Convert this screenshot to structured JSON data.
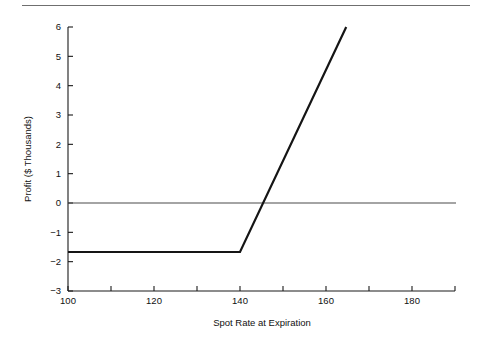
{
  "figure": {
    "top_rule_color": "#6f6f6f",
    "background": "#ffffff",
    "line_color": "#151515",
    "axis_color": "#1a1a1a",
    "zero_line_color": "#4a4a4a"
  },
  "chart_data": {
    "type": "line",
    "title": "",
    "xlabel": "Spot Rate at Expiration",
    "ylabel": "Profit ($ Thousands)",
    "xlim": [
      100,
      190
    ],
    "ylim": [
      -3,
      6
    ],
    "grid": false,
    "legend": "none",
    "x_ticks": [
      100,
      110,
      120,
      130,
      140,
      150,
      160,
      170,
      180,
      190
    ],
    "x_tick_labels": [
      "100",
      "",
      "120",
      "",
      "140",
      "",
      "160",
      "",
      "180",
      ""
    ],
    "y_ticks": [
      -3,
      -2,
      -1,
      0,
      1,
      2,
      3,
      4,
      5,
      6
    ],
    "y_tick_labels": [
      "−3",
      "−2",
      "−1",
      "0",
      "1",
      "2",
      "3",
      "4",
      "5",
      "6"
    ],
    "zero_reference_line": 0,
    "series": [
      {
        "name": "Profit",
        "x": [
          100,
          140,
          164.7
        ],
        "values": [
          -1.67,
          -1.67,
          6.0
        ],
        "breakeven_x": 143.8,
        "strike": 140,
        "premium": -1.67
      }
    ]
  }
}
